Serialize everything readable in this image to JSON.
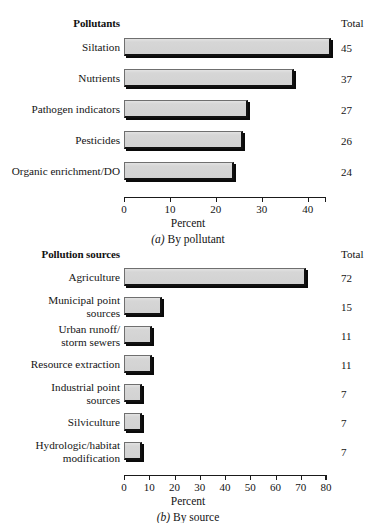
{
  "figures": [
    {
      "id": "a",
      "category_header": "Pollutants",
      "total_header": "Total",
      "axis_title": "Percent",
      "caption_marker": "(a)",
      "caption_text": " By pollutant",
      "caption_full": "(a) By pollutant",
      "rows": [
        {
          "label": "Siltation",
          "value": 45,
          "total": "45"
        },
        {
          "label": "Nutrients",
          "value": 37,
          "total": "37"
        },
        {
          "label": "Pathogen indicators",
          "value": 27,
          "total": "27"
        },
        {
          "label": "Pesticides",
          "value": 26,
          "total": "26"
        },
        {
          "label": "Organic enrichment/DO",
          "value": 24,
          "total": "24"
        }
      ],
      "ticks": [
        {
          "value": 0,
          "label": "0"
        },
        {
          "value": 10,
          "label": "10"
        },
        {
          "value": 20,
          "label": "20"
        },
        {
          "value": 30,
          "label": "30"
        },
        {
          "value": 40,
          "label": "40"
        }
      ],
      "axis_max": 44
    },
    {
      "id": "b",
      "category_header": "Pollution sources",
      "total_header": "Total",
      "axis_title": "Percent",
      "caption_marker": "(b)",
      "caption_text": " By source",
      "caption_full": "(b) By source",
      "rows": [
        {
          "label": "Agriculture",
          "value": 72,
          "total": "72"
        },
        {
          "label": "Municipal point\nsources",
          "value": 15,
          "total": "15"
        },
        {
          "label": "Urban runoff/\nstorm sewers",
          "value": 11,
          "total": "11"
        },
        {
          "label": "Resource extraction",
          "value": 11,
          "total": "11"
        },
        {
          "label": "Industrial point\nsources",
          "value": 7,
          "total": "7"
        },
        {
          "label": "Silviculture",
          "value": 7,
          "total": "7"
        },
        {
          "label": "Hydrologic/habitat\nmodification",
          "value": 7,
          "total": "7"
        }
      ],
      "ticks": [
        {
          "value": 0,
          "label": "0"
        },
        {
          "value": 10,
          "label": "10"
        },
        {
          "value": 20,
          "label": "20"
        },
        {
          "value": 30,
          "label": "30"
        },
        {
          "value": 40,
          "label": "40"
        },
        {
          "value": 50,
          "label": "50"
        },
        {
          "value": 60,
          "label": "60"
        },
        {
          "value": 70,
          "label": "70"
        },
        {
          "value": 80,
          "label": "80"
        }
      ],
      "axis_max": 80
    }
  ],
  "chart_data": [
    {
      "type": "bar",
      "orientation": "horizontal",
      "title": "Pollutants",
      "subtitle": "(a) By pollutant",
      "xlabel": "Percent",
      "ylabel": "",
      "categories": [
        "Siltation",
        "Nutrients",
        "Pathogen indicators",
        "Pesticides",
        "Organic enrichment/DO"
      ],
      "values": [
        45,
        37,
        27,
        26,
        24
      ],
      "data_labels": [
        "45",
        "37",
        "27",
        "26",
        "24"
      ],
      "data_label_header": "Total",
      "xlim": [
        0,
        44
      ],
      "xticks": [
        0,
        10,
        20,
        30,
        40
      ],
      "grid": false,
      "legend": false,
      "bar_fill": "#d2d2d2",
      "bar_edge": "#111111"
    },
    {
      "type": "bar",
      "orientation": "horizontal",
      "title": "Pollution sources",
      "subtitle": "(b) By source",
      "xlabel": "Percent",
      "ylabel": "",
      "categories": [
        "Agriculture",
        "Municipal point sources",
        "Urban runoff/storm sewers",
        "Resource extraction",
        "Industrial point sources",
        "Silviculture",
        "Hydrologic/habitat modification"
      ],
      "values": [
        72,
        15,
        11,
        11,
        7,
        7,
        7
      ],
      "data_labels": [
        "72",
        "15",
        "11",
        "11",
        "7",
        "7",
        "7"
      ],
      "data_label_header": "Total",
      "xlim": [
        0,
        80
      ],
      "xticks": [
        0,
        10,
        20,
        30,
        40,
        50,
        60,
        70,
        80
      ],
      "grid": false,
      "legend": false,
      "bar_fill": "#d2d2d2",
      "bar_edge": "#111111"
    }
  ]
}
